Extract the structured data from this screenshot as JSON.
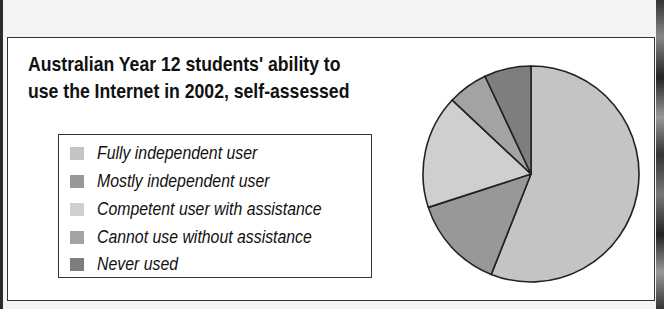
{
  "title_lines": [
    "Australian Year 12 students' ability to",
    "use the Internet in 2002, self-assessed"
  ],
  "legend": [
    {
      "label": "Fully independent user",
      "color": "#c4c4c4"
    },
    {
      "label": "Mostly independent user",
      "color": "#989898"
    },
    {
      "label": "Competent user with assistance",
      "color": "#cfcfcf"
    },
    {
      "label": "Cannot use without assistance",
      "color": "#a3a3a3"
    },
    {
      "label": "Never used",
      "color": "#7e7e7e"
    }
  ],
  "chart_data": {
    "type": "pie",
    "title": "Australian Year 12 students' ability to use the Internet in 2002, self-assessed",
    "categories": [
      "Fully independent user",
      "Mostly independent user",
      "Competent user with assistance",
      "Cannot use without assistance",
      "Never used"
    ],
    "values": [
      56,
      14,
      17,
      6,
      7
    ],
    "unit": "percent (estimated from slice angles)",
    "start_angle": "12 o'clock, clockwise",
    "legend_position": "left",
    "colors": [
      "#c4c4c4",
      "#989898",
      "#cfcfcf",
      "#a3a3a3",
      "#7e7e7e"
    ]
  }
}
